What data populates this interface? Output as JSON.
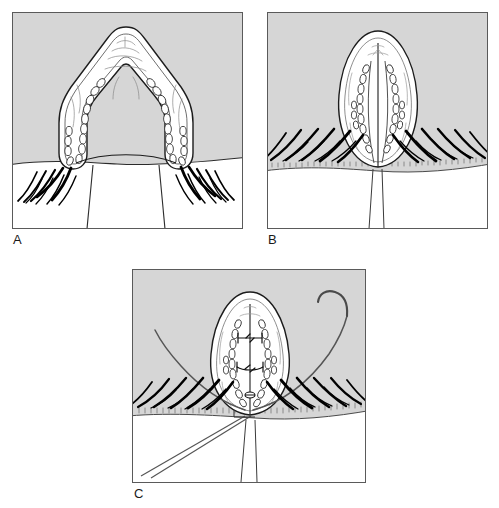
{
  "figure": {
    "caption_note": "Three-panel line illustration",
    "background_color": "#ffffff",
    "panel_fill": "#d6d6d6",
    "panel_border_color": "#5a5a5a",
    "ink_color": "#111111",
    "tissue_fill": "#ffffff",
    "lash_color": "#000000",
    "suture_color": "#555555"
  },
  "panels": [
    {
      "id": "A",
      "label": "A",
      "name": "panel-a",
      "description": "Full-thickness eyelid margin laceration gaping open in an inverted-V configuration; tarsal plate and meibomian gland rows visible along the wound edges; eyelashes project from the intact lid margin on either side of the defect.",
      "elements": [
        "gaping-wound-outline",
        "tarsal-plate",
        "meibomian-gland-chain-left",
        "meibomian-gland-chain-right",
        "lid-margin-line",
        "eyelash-row-left",
        "eyelash-row-right",
        "conjunctival-surface"
      ]
    },
    {
      "id": "B",
      "label": "B",
      "name": "panel-b",
      "description": "Wound edges approximated into a vertical almond-shaped apposition; the meibomian gland rows now lie parallel on either side of the midline vertical wound line; lash rows converge toward the repair site.",
      "elements": [
        "approximated-wound-outline",
        "midline-wound-line",
        "meibomian-gland-chain-left",
        "meibomian-gland-chain-right",
        "lid-margin-stipple-band",
        "eyelash-row-left",
        "eyelash-row-right",
        "vertical-traction-lines"
      ]
    },
    {
      "id": "C",
      "label": "C",
      "name": "panel-c",
      "description": "Two horizontal mattress sutures placed across the approximated wound; a curved surgical needle with attached suture thread exits at the upper right and a long double suture strand runs to the lower left.",
      "elements": [
        "approximated-wound-outline",
        "suture-knot-upper",
        "suture-knot-lower",
        "marginal-suture",
        "curved-needle",
        "suture-thread-right",
        "suture-thread-left",
        "lid-margin-stipple-band",
        "eyelash-row-left",
        "eyelash-row-right"
      ],
      "suture_count": 2,
      "needle_type": "curved"
    }
  ]
}
